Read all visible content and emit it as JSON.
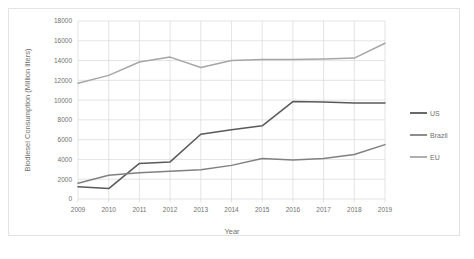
{
  "chart_data": {
    "type": "line",
    "title": "",
    "xlabel": "Year",
    "ylabel": "Biodiesel Consumption (Million liters)",
    "categories": [
      "2009",
      "2010",
      "2011",
      "2012",
      "2013",
      "2014",
      "2015",
      "2016",
      "2017",
      "2018",
      "2019"
    ],
    "x": [
      2009,
      2010,
      2011,
      2012,
      2013,
      2014,
      2015,
      2016,
      2017,
      2018,
      2019
    ],
    "ylim": [
      0,
      18000
    ],
    "ytick_labels": [
      "0",
      "2000",
      "4000",
      "6000",
      "8000",
      "10000",
      "12000",
      "14000",
      "16000",
      "18000"
    ],
    "yticks": [
      0,
      2000,
      4000,
      6000,
      8000,
      10000,
      12000,
      14000,
      16000,
      18000
    ],
    "grid": "horizontal-and-vertical",
    "legend_position": "right",
    "series": [
      {
        "name": "US",
        "color": "#595959",
        "values": [
          1250,
          1050,
          3600,
          3750,
          6550,
          7000,
          7400,
          9850,
          9800,
          9700,
          9700
        ]
      },
      {
        "name": "Brazil",
        "color": "#808080",
        "values": [
          1600,
          2400,
          2650,
          2800,
          2950,
          3400,
          4100,
          3950,
          4100,
          4500,
          5500
        ]
      },
      {
        "name": "EU",
        "color": "#a6a6a6",
        "values": [
          11700,
          12500,
          13850,
          14350,
          13300,
          14000,
          14100,
          14100,
          14150,
          14250,
          15750
        ]
      }
    ]
  },
  "colors": {
    "grid": "#d9d9d9",
    "axis_text": "#6f6f6f",
    "frame": "#e3e3e3",
    "background": "#ffffff"
  }
}
